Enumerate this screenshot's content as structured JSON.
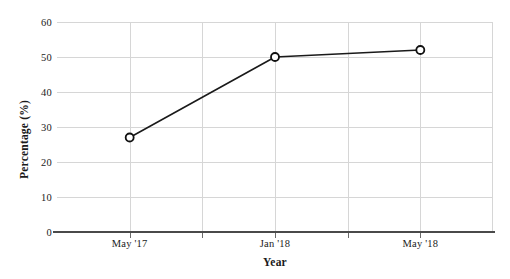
{
  "chart_data": {
    "type": "line",
    "title": "",
    "xlabel": "Year",
    "ylabel": "Percentage (%)",
    "categories": [
      "May '17",
      "Jan '18",
      "May '18"
    ],
    "x": [
      1,
      3,
      5
    ],
    "values": [
      27,
      50,
      52
    ],
    "series": [
      {
        "name": "Percentage",
        "values": [
          27,
          50,
          52
        ]
      }
    ],
    "ylim": [
      0,
      60
    ],
    "ytick_labels": [
      "0",
      "10",
      "20",
      "30",
      "40",
      "50",
      "60"
    ],
    "ytick_values": [
      0,
      10,
      20,
      30,
      40,
      50,
      60
    ],
    "xtick_labels": [
      "May '17",
      "Jan '18",
      "May '18"
    ],
    "xtick_positions": [
      1,
      3,
      5
    ],
    "x_gridline_count": 5,
    "grid": true,
    "legend": "none",
    "marker": "open-circle",
    "line_color": "#1a1a1a",
    "marker_fill": "#ffffff",
    "marker_stroke": "#111111",
    "grid_color": "#d6d6d6",
    "axis_color": "#4a4a4a",
    "background": "#ffffff"
  }
}
